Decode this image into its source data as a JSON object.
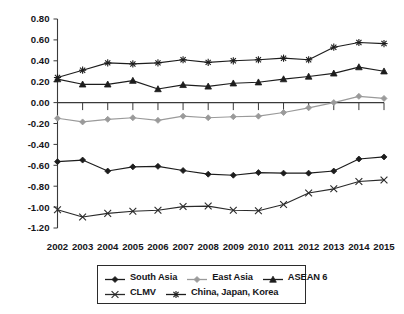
{
  "chart_data": {
    "type": "line",
    "title": "",
    "subtitle": "",
    "xlabel": "",
    "ylabel": "",
    "grid": false,
    "legend_position": "bottom",
    "xlim": [
      "2002",
      "2015"
    ],
    "ylim": [
      -1.2,
      0.8
    ],
    "ytick_step": 0.2,
    "categories": [
      "2002",
      "2003",
      "2004",
      "2005",
      "2006",
      "2007",
      "2008",
      "2009",
      "2010",
      "2011",
      "2012",
      "2013",
      "2014",
      "2015"
    ],
    "ytick_labels": [
      "0.80",
      "0.60",
      "0.40",
      "0.20",
      "0.00",
      "-0.20",
      "-0.40",
      "-0.60",
      "-0.80",
      "-1.00",
      "-1.20"
    ],
    "ytick_values": [
      0.8,
      0.6,
      0.4,
      0.2,
      0.0,
      -0.2,
      -0.4,
      -0.6,
      -0.8,
      -1.0,
      -1.2
    ],
    "series": [
      {
        "name": "South Asia",
        "marker": "diamond",
        "color": "#1d1d1d",
        "line_color": "#1d1d1d",
        "values": [
          -0.565,
          -0.55,
          -0.655,
          -0.615,
          -0.61,
          -0.65,
          -0.685,
          -0.695,
          -0.67,
          -0.675,
          -0.675,
          -0.655,
          -0.54,
          -0.52
        ]
      },
      {
        "name": "East Asia",
        "marker": "diamond",
        "color": "#9a9a9a",
        "line_color": "#9a9a9a",
        "values": [
          -0.15,
          -0.185,
          -0.16,
          -0.145,
          -0.17,
          -0.13,
          -0.145,
          -0.135,
          -0.13,
          -0.095,
          -0.05,
          0.0,
          0.06,
          0.04
        ]
      },
      {
        "name": "ASEAN 6",
        "marker": "triangle",
        "color": "#1d1d1d",
        "line_color": "#1d1d1d",
        "values": [
          0.225,
          0.175,
          0.175,
          0.21,
          0.13,
          0.17,
          0.155,
          0.185,
          0.195,
          0.225,
          0.25,
          0.28,
          0.34,
          0.3
        ]
      },
      {
        "name": "CLMV",
        "marker": "cross",
        "color": "#2a2a2a",
        "line_color": "#2a2a2a",
        "values": [
          -1.025,
          -1.095,
          -1.06,
          -1.04,
          -1.03,
          -0.995,
          -0.99,
          -1.03,
          -1.035,
          -0.975,
          -0.865,
          -0.825,
          -0.755,
          -0.74
        ]
      },
      {
        "name": "China, Japan, Korea",
        "marker": "asterisk",
        "color": "#1d1d1d",
        "line_color": "#1d1d1d",
        "values": [
          0.24,
          0.31,
          0.38,
          0.37,
          0.38,
          0.41,
          0.385,
          0.4,
          0.41,
          0.425,
          0.41,
          0.53,
          0.575,
          0.565
        ]
      }
    ]
  },
  "legend": {
    "rows": [
      [
        {
          "label": "South Asia",
          "series_index": 0
        },
        {
          "label": "East Asia",
          "series_index": 1
        },
        {
          "label": "ASEAN 6",
          "series_index": 2
        }
      ],
      [
        {
          "label": "CLMV",
          "series_index": 3
        },
        {
          "label": "China, Japan, Korea",
          "series_index": 4
        }
      ]
    ]
  },
  "colors": {
    "axis": "#3a3a3a",
    "text": "#16161a",
    "background": "#ffffff",
    "gray_series": "#9a9a9a",
    "black_series": "#1d1d1d"
  }
}
